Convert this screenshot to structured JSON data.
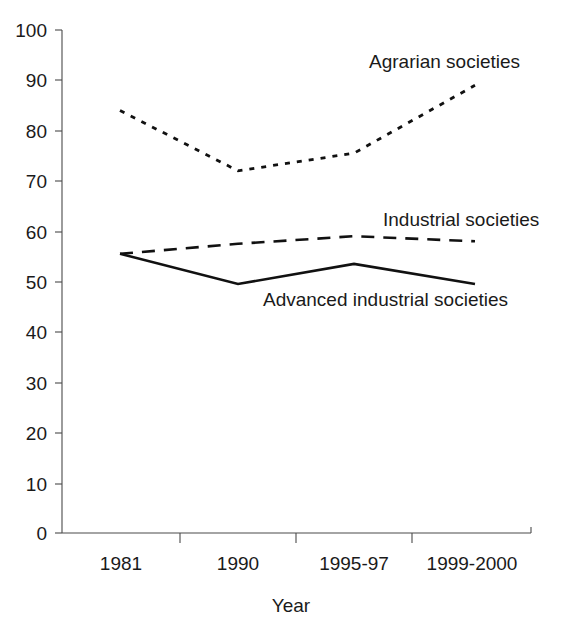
{
  "chart_data": {
    "type": "line",
    "title": "",
    "xlabel": "Year",
    "ylabel": "",
    "categories": [
      "1981",
      "1990",
      "1995-97",
      "1999-2000"
    ],
    "ylim": [
      0,
      100
    ],
    "xlim_categories": 4,
    "grid": false,
    "legend_position": "inline-annotations",
    "y_ticks": [
      "0",
      "10",
      "20",
      "30",
      "40",
      "50",
      "60",
      "70",
      "80",
      "90",
      "100"
    ],
    "y_tick_values": [
      0,
      10,
      20,
      30,
      40,
      50,
      60,
      70,
      80,
      90,
      100
    ],
    "series": [
      {
        "name": "Agrarian societies",
        "style": "dotted",
        "color": "#111111",
        "values": [
          84,
          72,
          75.5,
          89
        ]
      },
      {
        "name": "Industrial societies",
        "style": "dashed",
        "color": "#111111",
        "values": [
          55.5,
          57.5,
          59,
          58
        ]
      },
      {
        "name": "Advanced industrial societies",
        "style": "solid",
        "color": "#111111",
        "values": [
          55.5,
          49.5,
          53.5,
          49.5
        ]
      }
    ],
    "annotations": [
      {
        "text": "Agrarian societies",
        "x_px": 369,
        "y_px": 68
      },
      {
        "text": "Industrial societies",
        "x_px": 383,
        "y_px": 226
      },
      {
        "text": "Advanced industrial societies",
        "x_px": 263,
        "y_px": 306
      }
    ]
  },
  "axes": {
    "y_labels": [
      "100",
      "90",
      "80",
      "70",
      "60",
      "50",
      "40",
      "30",
      "20",
      "10",
      "0"
    ],
    "x_labels": [
      "1981",
      "1990",
      "1995-97",
      "1999-2000"
    ],
    "x_title": "Year"
  }
}
